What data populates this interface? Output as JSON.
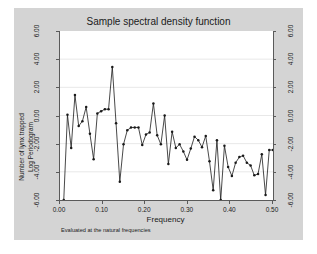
{
  "figure": {
    "background_color": "#d4d4d4",
    "plot_background_color": "#ffffff",
    "axis_color": "#5a5a5a",
    "series_color": "#1a1a1a",
    "grid_color": "#e8e8e8"
  },
  "chart_data": {
    "type": "line",
    "title": "Sample spectral density function",
    "xlabel": "Frequency",
    "ylabel_line1": "Number of lynx trapped",
    "ylabel_line2": "Log Periodogram",
    "note": "Evaluated at the natural frequencies",
    "xlim": [
      0.0,
      0.5
    ],
    "ylim": [
      -6.0,
      6.0
    ],
    "xticks": [
      "0.00",
      "0.10",
      "0.20",
      "0.30",
      "0.40",
      "0.50"
    ],
    "xtick_values": [
      0.0,
      0.1,
      0.2,
      0.3,
      0.4,
      0.5
    ],
    "yticks": [
      "6.00",
      "4.00",
      "2.00",
      "0.00",
      "-2.00",
      "-4.00",
      "-6.00"
    ],
    "ytick_values": [
      6.0,
      4.0,
      2.0,
      0.0,
      -2.0,
      -4.0,
      -6.0
    ],
    "yticks_right": [
      "6.00",
      "4.00",
      "2.00",
      "0.00",
      "-2.00",
      "-4.00",
      "-6.00"
    ],
    "grid": true,
    "grid_axis": "y",
    "legend": "none",
    "marker": "filled-circle",
    "x": [
      0.0088,
      0.0175,
      0.0263,
      0.0351,
      0.0439,
      0.0526,
      0.0614,
      0.0702,
      0.0789,
      0.0877,
      0.0965,
      0.1053,
      0.114,
      0.1228,
      0.1316,
      0.1404,
      0.1491,
      0.1579,
      0.1667,
      0.1754,
      0.1842,
      0.193,
      0.2018,
      0.2105,
      0.2193,
      0.2281,
      0.2368,
      0.2456,
      0.2544,
      0.2632,
      0.2719,
      0.2807,
      0.2895,
      0.2982,
      0.307,
      0.3158,
      0.3246,
      0.3333,
      0.3421,
      0.3509,
      0.3596,
      0.3684,
      0.3772,
      0.386,
      0.3947,
      0.4035,
      0.4123,
      0.4211,
      0.4298,
      0.4386,
      0.4474,
      0.4561,
      0.4649,
      0.4737,
      0.4825,
      0.4912,
      0.5
    ],
    "y": [
      -6.0,
      0.05,
      -2.3,
      1.45,
      -0.75,
      -0.4,
      0.6,
      -1.3,
      -3.1,
      0.15,
      0.3,
      0.45,
      0.45,
      3.45,
      -0.55,
      -4.7,
      -2.05,
      -1.05,
      -0.85,
      -0.85,
      -0.85,
      -2.1,
      -1.35,
      -1.2,
      0.85,
      -1.4,
      -2.05,
      0.0,
      -3.45,
      -1.15,
      -2.3,
      -2.05,
      -2.55,
      -3.15,
      -2.35,
      -1.5,
      -1.75,
      -2.25,
      -1.45,
      -3.25,
      -5.3,
      -1.75,
      -6.0,
      -2.15,
      -3.65,
      -4.3,
      -3.35,
      -2.95,
      -2.85,
      -3.35,
      -3.55,
      -4.25,
      -4.15,
      -2.75,
      -5.65,
      -2.45,
      -2.45
    ]
  }
}
